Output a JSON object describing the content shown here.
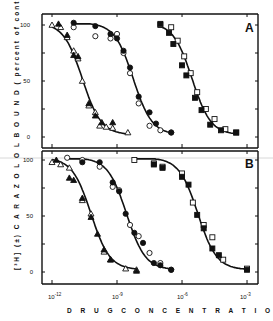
{
  "chart_data": [
    {
      "panel": "A",
      "type": "scatter",
      "title": "",
      "xlabel": "DRUG CONCENTRATION (M)",
      "ylabel": "[3H] (±) CARAZOLOL BOUND (percent of control)",
      "xscale": "log",
      "xlim_log10": [
        -12.2,
        -2.5
      ],
      "ylim": [
        -8,
        112
      ],
      "x_ticks": [
        "10^-12",
        "10^-9",
        "10^-6",
        "10^-3"
      ],
      "y_ticks": [
        0,
        50,
        100
      ],
      "series": [
        {
          "name": "open triangle",
          "marker": "triangle-open",
          "x_log10": [
            -12.0,
            -11.6,
            -11.3,
            -11.0,
            -10.8,
            -10.6,
            -10.3,
            -10.0,
            -9.8,
            -9.5,
            -9.2,
            -8.5
          ],
          "values": [
            100,
            98,
            89,
            77,
            70,
            50,
            28,
            22,
            10,
            9,
            8,
            4
          ]
        },
        {
          "name": "filled triangle",
          "marker": "triangle-filled",
          "x_log10": [
            -11.7,
            -11.3,
            -11.0,
            -10.8,
            -10.3,
            -10.0,
            -9.7,
            -9.2
          ],
          "values": [
            101,
            91,
            73,
            72,
            30,
            19,
            13,
            13
          ]
        },
        {
          "name": "open circle",
          "marker": "circle-open",
          "x_log10": [
            -11.0,
            -10.0,
            -9.3,
            -9.0,
            -8.7,
            -8.4,
            -8.0,
            -7.5,
            -7.0,
            -6.5
          ],
          "values": [
            98,
            90,
            88,
            92,
            75,
            57,
            30,
            10,
            6,
            4
          ]
        },
        {
          "name": "filled circle",
          "marker": "circle-filled",
          "x_log10": [
            -11.0,
            -10.0,
            -9.3,
            -9.0,
            -8.7,
            -8.4,
            -8.0,
            -7.5,
            -7.2,
            -6.5
          ],
          "values": [
            102,
            99,
            92,
            88,
            77,
            62,
            36,
            22,
            12,
            4
          ]
        },
        {
          "name": "open square",
          "marker": "square-open",
          "x_log10": [
            -7.0,
            -6.5,
            -6.2,
            -5.9,
            -5.6,
            -5.3,
            -4.9,
            -4.5,
            -4.0,
            -3.5
          ],
          "values": [
            100,
            98,
            86,
            72,
            57,
            40,
            25,
            16,
            7,
            4
          ]
        },
        {
          "name": "filled square",
          "marker": "square-filled",
          "x_log10": [
            -7.0,
            -6.6,
            -6.4,
            -6.0,
            -5.8,
            -5.4,
            -5.1,
            -4.7,
            -4.2,
            -3.5
          ],
          "values": [
            101,
            93,
            83,
            64,
            55,
            35,
            24,
            11,
            6,
            4
          ]
        }
      ]
    },
    {
      "panel": "B",
      "type": "scatter",
      "title": "",
      "xlabel": "DRUG CONCENTRATION (M)",
      "ylabel": "[3H] (±) CARAZOLOL BOUND (percent of control)",
      "xscale": "log",
      "xlim_log10": [
        -12.2,
        -2.5
      ],
      "ylim": [
        -8,
        112
      ],
      "x_ticks": [
        "10^-12",
        "10^-9",
        "10^-6",
        "10^-3"
      ],
      "y_ticks": [
        0,
        50,
        100
      ],
      "series": [
        {
          "name": "open triangle",
          "marker": "triangle-open",
          "x_log10": [
            -12.0,
            -11.6,
            -11.2,
            -10.6,
            -10.2,
            -9.6,
            -9.3,
            -8.6,
            -8.1
          ],
          "values": [
            98,
            96,
            93,
            64,
            52,
            18,
            11,
            3,
            2
          ]
        },
        {
          "name": "filled triangle",
          "marker": "triangle-filled",
          "x_log10": [
            -11.8,
            -11.2,
            -11.0,
            -10.6,
            -10.2,
            -9.9,
            -9.6,
            -9.3,
            -8.1
          ],
          "values": [
            100,
            84,
            82,
            66,
            49,
            34,
            20,
            11,
            1
          ]
        },
        {
          "name": "open circle",
          "marker": "circle-open",
          "x_log10": [
            -11.3,
            -10.6,
            -9.8,
            -9.2,
            -8.9,
            -8.4,
            -8.0,
            -7.5,
            -7.0,
            -6.5
          ],
          "values": [
            102,
            100,
            94,
            76,
            73,
            42,
            32,
            17,
            8,
            2
          ]
        },
        {
          "name": "filled circle",
          "marker": "circle-filled",
          "x_log10": [
            -10.6,
            -9.8,
            -9.2,
            -8.9,
            -8.6,
            -8.2,
            -7.8,
            -7.3,
            -7.0,
            -6.5
          ],
          "values": [
            98,
            98,
            80,
            72,
            52,
            35,
            26,
            8,
            6,
            2
          ]
        },
        {
          "name": "open square",
          "marker": "square-open",
          "x_log10": [
            -8.2,
            -7.3,
            -6.9,
            -6.0,
            -5.5,
            -5.0,
            -4.6,
            -4.1,
            -3.0
          ],
          "values": [
            100,
            97,
            94,
            88,
            62,
            42,
            31,
            11,
            3
          ]
        },
        {
          "name": "filled square",
          "marker": "square-filled",
          "x_log10": [
            -7.3,
            -6.9,
            -6.0,
            -5.7,
            -5.3,
            -5.0,
            -4.6,
            -4.3,
            -3.0
          ],
          "values": [
            96,
            93,
            85,
            78,
            51,
            39,
            21,
            15,
            2
          ]
        }
      ]
    }
  ],
  "labels": {
    "panel_a": "A",
    "panel_b": "B",
    "xlabel": "D R U G   C O N C E N T R A T I O N     (M)",
    "ylabel": "[³H] (±) C A R A Z O L O L   B O U N D   ( percent of control )",
    "x_ticks": [
      {
        "base": "10",
        "exp": "-12"
      },
      {
        "base": "10",
        "exp": "-9"
      },
      {
        "base": "10",
        "exp": "-6"
      },
      {
        "base": "10",
        "exp": "-3"
      }
    ],
    "y_ticks": [
      "100",
      "50",
      "0"
    ]
  }
}
